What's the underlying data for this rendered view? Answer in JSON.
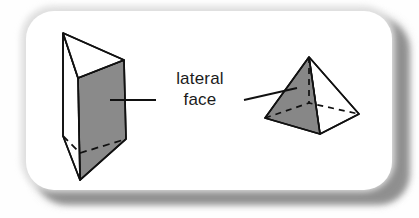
{
  "diagram": {
    "title": "lateral face",
    "label": {
      "line1": "lateral",
      "line2": "face"
    },
    "colors": {
      "shaded_face": "#8a8a8a",
      "shaded_face_pyramid": "#878787",
      "outline": "#111111",
      "card_background": "#ffffff",
      "card_halo": "#dedede",
      "card_shadow": "#8d8d8d",
      "page_background": "#fefefe",
      "text": "#1b1b1b"
    },
    "shapes": [
      {
        "name": "triangular-prism",
        "type": "prism",
        "side": "left",
        "shaded_lateral_face": true,
        "vertices": {
          "top_back_left": [
            63,
            33
          ],
          "top_front": [
            78,
            78
          ],
          "top_right": [
            124,
            60
          ],
          "bottom_back_left": [
            63,
            136
          ],
          "bottom_front": [
            80,
            180
          ],
          "bottom_right": [
            126,
            139
          ]
        },
        "hidden_edges": [
          [
            [
              63,
              136
            ],
            [
              80,
              153
            ]
          ],
          [
            [
              80,
              153
            ],
            [
              126,
              139
            ]
          ]
        ]
      },
      {
        "name": "square-pyramid",
        "type": "pyramid",
        "side": "right",
        "shaded_lateral_face": true,
        "vertices": {
          "apex": [
            309,
            57
          ],
          "base_left": [
            265,
            118
          ],
          "base_front": [
            320,
            134
          ],
          "base_right": [
            359,
            114
          ],
          "base_back": [
            309,
            103
          ]
        },
        "hidden_edges": [
          [
            [
              309,
              57
            ],
            [
              309,
              103
            ]
          ],
          [
            [
              265,
              118
            ],
            [
              309,
              103
            ]
          ],
          [
            [
              309,
              103
            ],
            [
              359,
              114
            ]
          ]
        ]
      }
    ],
    "leader_lines": [
      {
        "name": "leader-line-left",
        "from": [
          156,
          100
        ],
        "to": [
          110,
          100
        ],
        "points_to": "triangular-prism-lateral-face"
      },
      {
        "name": "leader-line-right",
        "from": [
          244,
          100
        ],
        "to": [
          296,
          88
        ],
        "points_to": "square-pyramid-lateral-face"
      }
    ]
  }
}
